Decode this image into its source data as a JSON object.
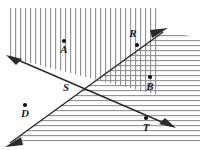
{
  "figure": {
    "canvas": {
      "width": 204,
      "height": 150,
      "background": "#ffffff"
    },
    "line_color": "#2b2b2b",
    "hatch_color": "#8a8a8a",
    "point_color": "#111111",
    "label_color": "#1a1a1a",
    "points": [
      {
        "id": "A",
        "label": "A",
        "x": 64,
        "y": 41,
        "label_x": 64,
        "label_y": 53,
        "dot": true
      },
      {
        "id": "R",
        "label": "R",
        "x": 137,
        "y": 45,
        "label_x": 133,
        "label_y": 37,
        "dot": true
      },
      {
        "id": "B",
        "label": "B",
        "x": 150,
        "y": 77,
        "label_x": 150,
        "label_y": 90,
        "dot": true
      },
      {
        "id": "S",
        "label": "S",
        "x": 78,
        "y": 88,
        "label_x": 66,
        "label_y": 91,
        "dot": false
      },
      {
        "id": "D",
        "label": "D",
        "x": 25,
        "y": 105,
        "label_x": 25,
        "label_y": 117,
        "dot": true
      },
      {
        "id": "T",
        "label": "T",
        "x": 146,
        "y": 118,
        "label_x": 146,
        "label_y": 131,
        "dot": true
      }
    ],
    "lines": [
      {
        "id": "descending-line",
        "name": "line-through-S-and-T",
        "x1": 11,
        "y1": 57,
        "x2": 171,
        "y2": 126,
        "arrow_start": true,
        "arrow_end": true
      },
      {
        "id": "ascending-line",
        "name": "line-through-S-and-R",
        "x1": 10,
        "y1": 143,
        "x2": 163,
        "y2": 32,
        "arrow_start": true,
        "arrow_end": true
      }
    ],
    "regions": [
      {
        "id": "vertical-hatch",
        "name": "vertical-hatched-region",
        "hatch": "vertical",
        "description": "Upper-left half-plane above the descending line, left of x=158"
      },
      {
        "id": "horizontal-hatch",
        "name": "horizontal-hatched-region",
        "hatch": "horizontal",
        "description": "Lower-right half-plane below the ascending line"
      }
    ]
  }
}
